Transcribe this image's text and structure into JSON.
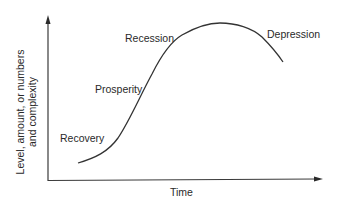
{
  "diagram": {
    "y_axis_label_line1": "Level, amount, or numbers",
    "y_axis_label_line2": "and complexity",
    "x_axis_label": "Time",
    "phases": [
      {
        "label": "Recovery"
      },
      {
        "label": "Prosperity"
      },
      {
        "label": "Recession"
      },
      {
        "label": "Depression"
      }
    ],
    "colors": {
      "line": "#333333",
      "text": "#2a2a2a",
      "background": "#ffffff"
    }
  }
}
